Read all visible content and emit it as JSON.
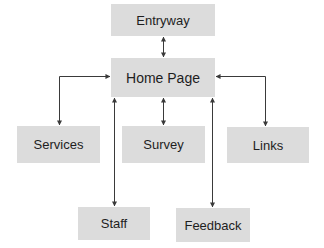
{
  "diagram": {
    "type": "site-map",
    "colors": {
      "box_fill": "#dcdcdc",
      "line": "#3a3a3a",
      "text": "#1e1e1e",
      "background": "#ffffff"
    },
    "nodes": [
      {
        "id": "entryway",
        "label": "Entryway",
        "x": 111,
        "y": 4,
        "w": 104,
        "h": 32
      },
      {
        "id": "home",
        "label": "Home Page",
        "x": 111,
        "y": 58,
        "w": 104,
        "h": 39
      },
      {
        "id": "services",
        "label": "Services",
        "x": 17,
        "y": 126,
        "w": 83,
        "h": 37
      },
      {
        "id": "survey",
        "label": "Survey",
        "x": 122,
        "y": 126,
        "w": 83,
        "h": 37
      },
      {
        "id": "links",
        "label": "Links",
        "x": 227,
        "y": 127,
        "w": 82,
        "h": 36
      },
      {
        "id": "staff",
        "label": "Staff",
        "x": 78,
        "y": 207,
        "w": 72,
        "h": 33
      },
      {
        "id": "feedback",
        "label": "Feedback",
        "x": 176,
        "y": 208,
        "w": 74,
        "h": 34
      }
    ],
    "edges": [
      {
        "from": "entryway",
        "to": "home",
        "bidirectional": true
      },
      {
        "from": "home",
        "to": "services",
        "bidirectional": true
      },
      {
        "from": "home",
        "to": "survey",
        "bidirectional": true
      },
      {
        "from": "home",
        "to": "links",
        "bidirectional": true
      },
      {
        "from": "home",
        "to": "staff",
        "bidirectional": true
      },
      {
        "from": "home",
        "to": "feedback",
        "bidirectional": true
      }
    ]
  }
}
